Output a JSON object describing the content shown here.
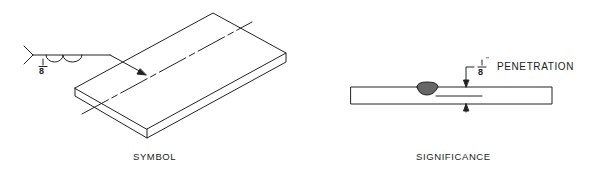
{
  "figures": [
    {
      "id": "symbol",
      "caption": "SYMBOL",
      "weld_symbol": {
        "size_fraction": {
          "numerator": "1",
          "denominator": "8"
        },
        "weld_type": "melt-through / back weld (semicircle pair)"
      }
    },
    {
      "id": "significance",
      "caption": "SIGNIFICANCE",
      "dimension": {
        "fraction": {
          "numerator": "1",
          "denominator": "8",
          "unit_mark": "\""
        },
        "label": "PENETRATION"
      }
    }
  ],
  "colors": {
    "line": "#222222",
    "bead": "#555555",
    "background": "#ffffff"
  }
}
